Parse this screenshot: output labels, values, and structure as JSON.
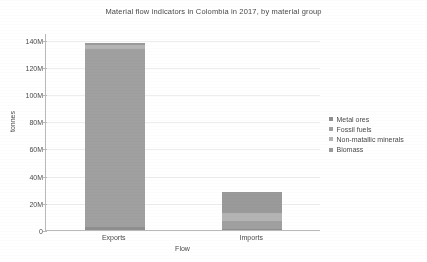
{
  "chart_data": {
    "type": "bar",
    "title": "Material flow indicators in Colombia in 2017, by material group",
    "xlabel": "Flow",
    "ylabel": "tonnes",
    "categories": [
      "Exports",
      "Imports"
    ],
    "ylim": [
      0,
      145000000
    ],
    "ytick_labels": [
      "0",
      "20M",
      "40M",
      "60M",
      "80M",
      "100M",
      "120M",
      "140M"
    ],
    "ytick_values": [
      0,
      20000000,
      40000000,
      60000000,
      80000000,
      100000000,
      120000000,
      140000000
    ],
    "grid": true,
    "stacked": true,
    "legend_position": "right",
    "series": [
      {
        "name": "Metal ores",
        "color": "#8f8f8f",
        "values": [
          2000000,
          1000000
        ]
      },
      {
        "name": "Fossil fuels",
        "color": "#a0a0a0",
        "values": [
          131000000,
          5500000
        ]
      },
      {
        "name": "Non-matallic minerals",
        "color": "#b4b4b4",
        "values": [
          3000000,
          6000000
        ]
      },
      {
        "name": "Biomass",
        "color": "#9a9a9a",
        "values": [
          2000000,
          15500000
        ]
      }
    ],
    "totals": [
      138000000,
      28000000
    ]
  },
  "legend": {
    "items": [
      {
        "label": "Metal ores"
      },
      {
        "label": "Fossil fuels"
      },
      {
        "label": "Non-matallic minerals"
      },
      {
        "label": "Biomass"
      }
    ]
  }
}
